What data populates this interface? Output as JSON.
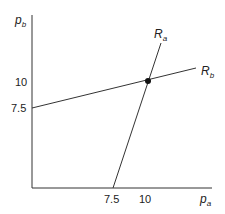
{
  "diagram": {
    "axes": {
      "y_label": {
        "main": "p",
        "sub": "b"
      },
      "x_label": {
        "main": "p",
        "sub": "a"
      },
      "y_ticks": [
        "10",
        "7.5"
      ],
      "x_ticks": [
        "7.5",
        "10"
      ]
    },
    "curves": [
      {
        "name": "R_a",
        "label": {
          "main": "R",
          "sub": "a"
        },
        "from": [
          7.5,
          0
        ],
        "to": "above intersection"
      },
      {
        "name": "R_b",
        "label": {
          "main": "R",
          "sub": "b"
        },
        "from": [
          0,
          7.5
        ],
        "to": "right of intersection"
      }
    ],
    "equilibrium_point": {
      "pa": 10,
      "pb": 10
    },
    "colors": {
      "line": "#333333",
      "point": "#111111"
    }
  }
}
